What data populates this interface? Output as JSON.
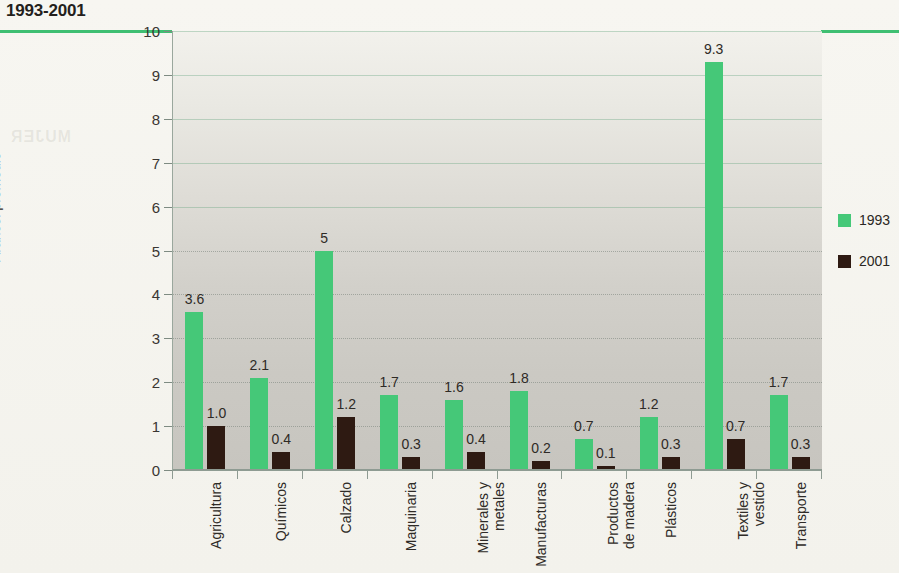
{
  "title": "1993-2001",
  "legend": {
    "position": "right",
    "entries": [
      {
        "label": "1993",
        "color": "#45c878"
      },
      {
        "label": "2001",
        "color": "#2e1a12"
      }
    ]
  },
  "axis": {
    "ylabel": "Arancel promedio",
    "yticks": [
      "0",
      "1",
      "2",
      "3",
      "4",
      "5",
      "6",
      "7",
      "8",
      "9",
      "10"
    ]
  },
  "ghost_text": {
    "line1": "EN LOS UMBRALES DEL SIGLO",
    "line2": "CONDICION",
    "line3": "DE LA",
    "line4": "MUJER",
    "line5": "EN LA ARGENTINA",
    "line6": "NUEVOS ROLES"
  },
  "chart_data": {
    "type": "bar",
    "title": "1993-2001",
    "xlabel": "",
    "ylabel": "Arancel promedio",
    "ylim": [
      0,
      10
    ],
    "ytick_step": 1,
    "grid": true,
    "legend_position": "right",
    "categories": [
      "Agricultura",
      "Químicos",
      "Calzado",
      "Maquinaria",
      "Minerales y metales",
      "Manufacturas",
      "Productos de madera",
      "Plásticos",
      "Textiles y vestido",
      "Transporte"
    ],
    "category_lines": [
      [
        "Agricultura"
      ],
      [
        "Químicos"
      ],
      [
        "Calzado"
      ],
      [
        "Maquinaria"
      ],
      [
        "Minerales y",
        "metales"
      ],
      [
        "Manufacturas"
      ],
      [
        "Productos",
        "de madera"
      ],
      [
        "Plásticos"
      ],
      [
        "Textiles y",
        "vestido"
      ],
      [
        "Transporte"
      ]
    ],
    "series": [
      {
        "name": "1993",
        "color": "#45c878",
        "values": [
          3.6,
          2.1,
          5.0,
          1.7,
          1.6,
          1.8,
          0.7,
          1.2,
          9.3,
          1.7
        ],
        "labels": [
          "3.6",
          "2.1",
          "5",
          "1.7",
          "1.6",
          "1.8",
          "0.7",
          "1.2",
          "9.3",
          "1.7"
        ]
      },
      {
        "name": "2001",
        "color": "#2e1a12",
        "values": [
          1.0,
          0.4,
          1.2,
          0.3,
          0.4,
          0.2,
          0.1,
          0.3,
          0.7,
          0.3
        ],
        "labels": [
          "1.0",
          "0.4",
          "1.2",
          "0.3",
          "0.4",
          "0.2",
          "0.1",
          "0.3",
          "0.7",
          "0.3"
        ]
      }
    ]
  }
}
